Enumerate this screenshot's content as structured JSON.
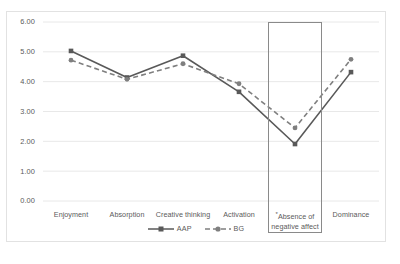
{
  "chart_data": {
    "type": "line",
    "title": "",
    "xlabel": "",
    "ylabel": "",
    "ylim": [
      0,
      6
    ],
    "ystep": 1,
    "grid": true,
    "legend_position": "bottom-center",
    "categories": [
      "Enjoyment",
      "Absorption",
      "Creative thinking",
      "Absence of negative affect",
      "Activation",
      "Dominance"
    ],
    "x": [
      "Enjoyment",
      "Absorption",
      "Creative thinking",
      "Activation",
      "Absence of negative affect",
      "Dominance"
    ],
    "series": [
      {
        "name": "AAP",
        "values": [
          5.03,
          4.14,
          4.87,
          3.66,
          1.91,
          4.32
        ],
        "style": "solid",
        "color": "#595959",
        "marker": "square"
      },
      {
        "name": "BG",
        "values": [
          4.72,
          4.08,
          4.6,
          3.93,
          2.45,
          4.75
        ],
        "style": "dashed",
        "color": "#7f7f7f",
        "marker": "circle"
      }
    ],
    "ytick_labels": [
      "0.00",
      "1.00",
      "2.00",
      "3.00",
      "4.00",
      "5.00",
      "6.00"
    ],
    "annotations": [
      {
        "type": "rect",
        "label": "highlight-absence-of-negative-affect",
        "category": "Absence of negative affect"
      }
    ]
  },
  "xaxis": {
    "labels": [
      {
        "line1": "Enjoyment",
        "line2": "",
        "star": ""
      },
      {
        "line1": "Absorption",
        "line2": "",
        "star": ""
      },
      {
        "line1": "Creative thinking",
        "line2": "",
        "star": ""
      },
      {
        "line1": "Activation",
        "line2": "",
        "star": ""
      },
      {
        "line1": "Absence of",
        "line2": "negative affect",
        "star": "*"
      },
      {
        "line1": "Dominance",
        "line2": "",
        "star": ""
      }
    ]
  },
  "legend": {
    "items": [
      {
        "label": "AAP"
      },
      {
        "label": "BG"
      }
    ]
  },
  "colors": {
    "series_aap": "#595959",
    "series_bg": "#7f7f7f",
    "gridline": "#e8e8e8",
    "border": "#e2e2e2",
    "highlight": "#8a8a8a",
    "text": "#5a5a5a"
  }
}
